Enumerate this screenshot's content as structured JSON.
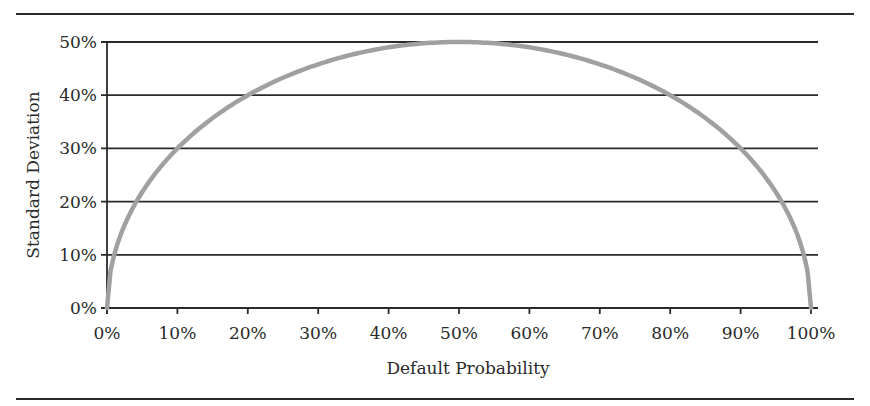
{
  "chart_data": {
    "type": "line",
    "title": "",
    "xlabel": "Default Probability",
    "ylabel": "Standard Deviation",
    "xlim": [
      0,
      100
    ],
    "ylim": [
      0,
      50
    ],
    "grid": {
      "horizontal": true,
      "vertical": false
    },
    "legend": null,
    "x_ticks": [
      "0%",
      "10%",
      "20%",
      "30%",
      "40%",
      "50%",
      "60%",
      "70%",
      "80%",
      "90%",
      "100%"
    ],
    "y_ticks": [
      "0%",
      "10%",
      "20%",
      "30%",
      "40%",
      "50%"
    ],
    "series": [
      {
        "name": "Standard Deviation",
        "color": "#a0a0a0",
        "x": [
          0,
          1,
          2,
          5,
          10,
          20,
          30,
          40,
          50,
          60,
          70,
          80,
          90,
          95,
          98,
          99,
          100
        ],
        "values": [
          0,
          9.9,
          14.0,
          21.8,
          30.0,
          40.0,
          45.8,
          49.0,
          50.0,
          49.0,
          45.8,
          40.0,
          30.0,
          21.8,
          14.0,
          9.9,
          0
        ]
      }
    ]
  },
  "colors": {
    "axis": "#2a2a2a",
    "curve": "#a0a0a0",
    "background": "#ffffff"
  }
}
